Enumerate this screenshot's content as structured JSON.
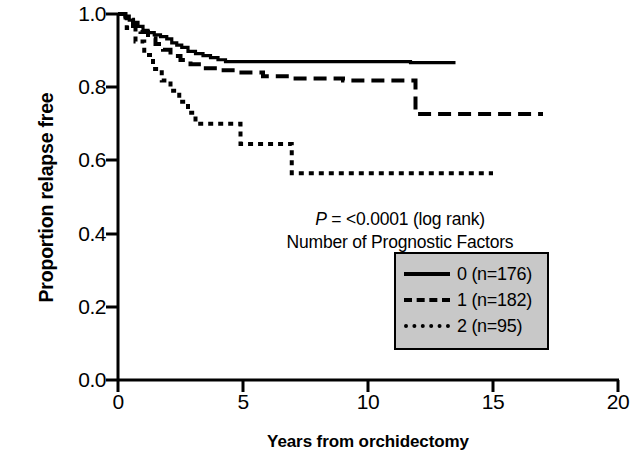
{
  "chart_data": {
    "type": "line",
    "subtype": "kaplan-meier-step",
    "title": "",
    "xlabel": "Years from orchidectomy",
    "ylabel": "Proportion relapse free",
    "xlim": [
      0,
      20
    ],
    "ylim": [
      0.0,
      1.0
    ],
    "xticks": [
      "0",
      "5",
      "10",
      "15",
      "20"
    ],
    "xtick_values": [
      0,
      5,
      10,
      15,
      20
    ],
    "yticks": [
      "0.0",
      "0.2",
      "0.4",
      "0.6",
      "0.8",
      "1.0"
    ],
    "ytick_values": [
      0.0,
      0.2,
      0.4,
      0.6,
      0.8,
      1.0
    ],
    "grid": false,
    "legend_position": "inside-lower-right",
    "annotations": [
      "P = <0.0001 (log rank)",
      "Number of Prognostic Factors"
    ],
    "annotation_parts": {
      "p_italic": "P",
      "p_rest": " = <0.0001 (log rank)",
      "factors_line": "Number of Prognostic Factors"
    },
    "series": [
      {
        "name": "0 (n=176)",
        "label": "0 (n=176)",
        "n": 176,
        "factors": 0,
        "style": "solid",
        "points": [
          [
            0.0,
            1.0
          ],
          [
            0.28,
            0.994
          ],
          [
            0.45,
            0.983
          ],
          [
            0.62,
            0.977
          ],
          [
            0.8,
            0.966
          ],
          [
            1.0,
            0.955
          ],
          [
            1.2,
            0.949
          ],
          [
            1.45,
            0.943
          ],
          [
            1.7,
            0.938
          ],
          [
            1.95,
            0.932
          ],
          [
            2.15,
            0.921
          ],
          [
            2.35,
            0.915
          ],
          [
            2.55,
            0.909
          ],
          [
            2.8,
            0.898
          ],
          [
            3.1,
            0.892
          ],
          [
            3.4,
            0.886
          ],
          [
            3.7,
            0.881
          ],
          [
            4.0,
            0.875
          ],
          [
            4.3,
            0.87
          ],
          [
            11.7,
            0.867
          ],
          [
            13.5,
            0.867
          ]
        ]
      },
      {
        "name": "1 (n=182)",
        "label": "1 (n=182)",
        "n": 182,
        "factors": 1,
        "style": "dashed",
        "points": [
          [
            0.0,
            1.0
          ],
          [
            0.3,
            0.984
          ],
          [
            0.6,
            0.967
          ],
          [
            0.9,
            0.951
          ],
          [
            1.2,
            0.934
          ],
          [
            1.5,
            0.918
          ],
          [
            1.8,
            0.902
          ],
          [
            2.1,
            0.885
          ],
          [
            2.5,
            0.874
          ],
          [
            2.9,
            0.863
          ],
          [
            3.4,
            0.852
          ],
          [
            4.0,
            0.846
          ],
          [
            4.8,
            0.84
          ],
          [
            5.8,
            0.83
          ],
          [
            7.0,
            0.824
          ],
          [
            9.0,
            0.818
          ],
          [
            11.9,
            0.818
          ],
          [
            11.9,
            0.727
          ],
          [
            17.0,
            0.727
          ]
        ]
      },
      {
        "name": "2 (n=95)",
        "label": "2 (n=95)",
        "n": 95,
        "factors": 2,
        "style": "dotted",
        "points": [
          [
            0.0,
            1.0
          ],
          [
            0.35,
            0.962
          ],
          [
            0.7,
            0.925
          ],
          [
            1.05,
            0.888
          ],
          [
            1.4,
            0.85
          ],
          [
            1.75,
            0.818
          ],
          [
            2.1,
            0.79
          ],
          [
            2.45,
            0.76
          ],
          [
            2.8,
            0.73
          ],
          [
            3.1,
            0.7
          ],
          [
            4.0,
            0.7
          ],
          [
            4.75,
            0.7
          ],
          [
            4.9,
            0.645
          ],
          [
            6.95,
            0.645
          ],
          [
            6.95,
            0.565
          ],
          [
            15.0,
            0.565
          ]
        ]
      }
    ]
  },
  "legend": {
    "items": [
      {
        "label": "0 (n=176)",
        "style": "solid"
      },
      {
        "label": "1 (n=182)",
        "style": "dashed"
      },
      {
        "label": "2 (n=95)",
        "style": "dotted"
      }
    ],
    "background_color": "#c8c8c8",
    "border_color": "#000000"
  },
  "colors": {
    "line": "#000000",
    "background": "#ffffff",
    "legend_fill": "#c8c8c8"
  }
}
